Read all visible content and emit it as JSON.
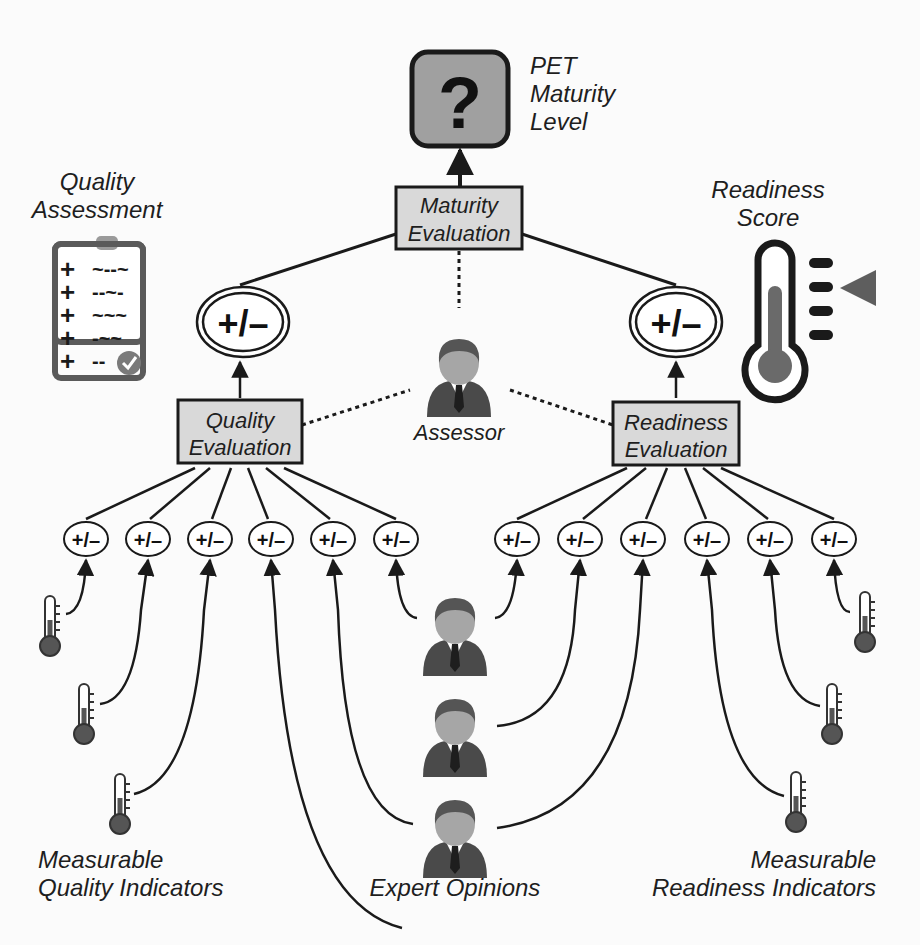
{
  "labels": {
    "pet_maturity": [
      "PET",
      "Maturity",
      "Level"
    ],
    "quality_assessment": [
      "Quality",
      "Assessment"
    ],
    "readiness_score": [
      "Readiness",
      "Score"
    ],
    "assessor": "Assessor",
    "expert_opinions": "Expert Opinions",
    "measurable_quality": [
      "Measurable",
      "Quality Indicators"
    ],
    "measurable_readiness": [
      "Measurable",
      "Readiness Indicators"
    ]
  },
  "boxes": {
    "maturity_evaluation": [
      "Maturity",
      "Evaluation"
    ],
    "quality_evaluation": [
      "Quality",
      "Evaluation"
    ],
    "readiness_evaluation": [
      "Readiness",
      "Evaluation"
    ]
  },
  "symbols": {
    "question_mark": "?",
    "plus_minus": "+/–"
  },
  "clipboard_rows": [
    "~--~",
    "--~-",
    "~~~",
    "-~~",
    "--"
  ],
  "colors": {
    "box_fill": "#d9d9d9",
    "icon_dark": "#3c3c3c",
    "icon_mid": "#7a7a7a",
    "face": "#a9a9a9",
    "line": "#1a1a1a"
  }
}
